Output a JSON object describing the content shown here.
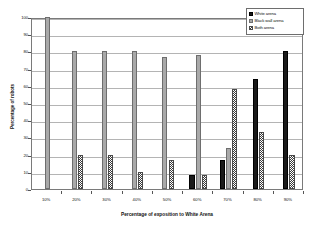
{
  "chart_data": {
    "type": "bar",
    "title": "",
    "xlabel": "Percentage of exposition to White Arena",
    "ylabel": "Percentage of robots",
    "categories": [
      "10%",
      "20%",
      "30%",
      "40%",
      "50%",
      "60%",
      "70%",
      "80%",
      "90%"
    ],
    "ylim": [
      0,
      100
    ],
    "yticks": [
      0,
      10,
      20,
      30,
      40,
      50,
      60,
      70,
      80,
      90,
      100
    ],
    "ytick_labels": [
      "0",
      "10",
      "20",
      "30",
      "40",
      "50",
      "60",
      "70",
      "80",
      "90",
      "100"
    ],
    "grid": true,
    "legend_position": "top-right",
    "series": [
      {
        "name": "White arena",
        "color": "#1a1a1a",
        "fill": "solid-black",
        "values": [
          0,
          0,
          0,
          0,
          0,
          8,
          17,
          64,
          80
        ]
      },
      {
        "name": "Black wall arena",
        "color": "#a9a9a9",
        "fill": "solid-gray",
        "values": [
          100,
          80,
          80,
          80,
          77,
          78,
          24,
          0,
          0
        ]
      },
      {
        "name": "Both arena",
        "color": "#3c3c3c",
        "fill": "checkered",
        "values": [
          0,
          20,
          20,
          10,
          17,
          8,
          58,
          33,
          20
        ]
      }
    ]
  },
  "legend": {
    "entries": [
      {
        "label": "White arena"
      },
      {
        "label": "Black wall arena"
      },
      {
        "label": "Both arena"
      }
    ]
  },
  "colors": {
    "series_white": "#1a1a1a",
    "series_blackwall": "#a9a9a9",
    "series_both": "#3c3c3c",
    "gridline": "#b4b4b4",
    "frame": "#7a7a7a",
    "background": "#ffffff"
  }
}
